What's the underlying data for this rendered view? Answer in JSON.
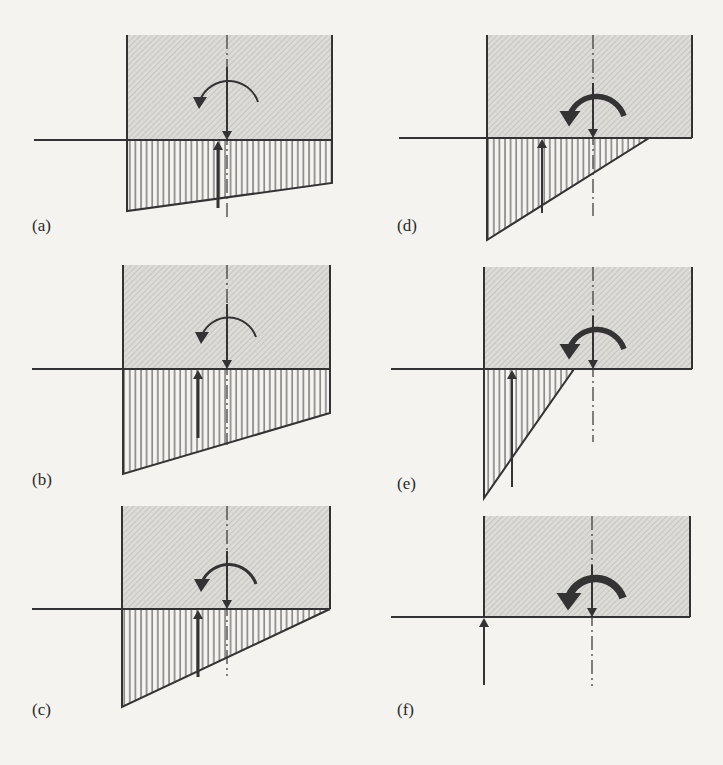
{
  "figure": {
    "colors": {
      "background": "#f4f3f0",
      "ink": "#333333",
      "soil_fill": "#dcdbd8",
      "soil_hatch": "#bdbcb8",
      "pressure_hatch": "#444444"
    },
    "panels": [
      {
        "id": "a",
        "label": "(a)",
        "footing": {
          "left": 127,
          "right": 332,
          "top": 35,
          "base": 140
        },
        "ground_line_start": 34,
        "centerline_x": 227,
        "centerline_bottom": 220,
        "pressure": {
          "left_depth": 211,
          "right_depth": 183,
          "zero_x": null
        },
        "reaction_arrow": {
          "x": 218,
          "bottom": 208
        },
        "moment": {
          "cx": 227,
          "cy": 96,
          "r": 31,
          "weight": "thin"
        },
        "label_pos": {
          "x": 32,
          "y": 216
        }
      },
      {
        "id": "b",
        "label": "(b)",
        "footing": {
          "left": 123,
          "right": 330,
          "top": 265,
          "base": 369
        },
        "ground_line_start": 32,
        "centerline_x": 227,
        "centerline_bottom": 445,
        "pressure": {
          "left_depth": 474,
          "right_depth": 413,
          "zero_x": null
        },
        "reaction_arrow": {
          "x": 198,
          "bottom": 438
        },
        "moment": {
          "cx": 227,
          "cy": 331,
          "r": 29,
          "weight": "thin"
        },
        "label_pos": {
          "x": 32,
          "y": 470
        }
      },
      {
        "id": "c",
        "label": "(c)",
        "footing": {
          "left": 122,
          "right": 330,
          "top": 506,
          "base": 609
        },
        "ground_line_start": 32,
        "centerline_x": 227,
        "centerline_bottom": 676,
        "pressure": {
          "left_depth": 707,
          "right_depth": 609,
          "zero_x": 330
        },
        "reaction_arrow": {
          "x": 198,
          "bottom": 677
        },
        "moment": {
          "cx": 227,
          "cy": 578,
          "r": 29,
          "weight": "medium"
        },
        "label_pos": {
          "x": 32,
          "y": 700
        }
      },
      {
        "id": "d",
        "label": "(d)",
        "footing": {
          "left": 487,
          "right": 692,
          "top": 35,
          "base": 138
        },
        "ground_line_start": 399,
        "centerline_x": 593,
        "centerline_bottom": 216,
        "pressure": {
          "left_depth": 240,
          "right_depth": 138,
          "zero_x": 649
        },
        "reaction_arrow": {
          "x": 542,
          "bottom": 213
        },
        "moment": {
          "cx": 595,
          "cy": 110,
          "r": 29,
          "weight": "bold"
        },
        "label_pos": {
          "x": 397,
          "y": 216
        }
      },
      {
        "id": "e",
        "label": "(e)",
        "footing": {
          "left": 484,
          "right": 692,
          "top": 267,
          "base": 369
        },
        "ground_line_start": 391,
        "centerline_x": 593,
        "centerline_bottom": 442,
        "pressure": {
          "left_depth": 498,
          "right_depth": 369,
          "zero_x": 574
        },
        "reaction_arrow": {
          "x": 512,
          "bottom": 487
        },
        "moment": {
          "cx": 595,
          "cy": 343,
          "r": 29,
          "weight": "bold"
        },
        "label_pos": {
          "x": 397,
          "y": 474
        }
      },
      {
        "id": "f",
        "label": "(f)",
        "footing": {
          "left": 484,
          "right": 690,
          "top": 516,
          "base": 617
        },
        "ground_line_start": 391,
        "centerline_x": 592,
        "centerline_bottom": 686,
        "pressure": {
          "left_depth": 617,
          "right_depth": 617,
          "zero_x": 484
        },
        "reaction_arrow": {
          "x": 484,
          "bottom": 685
        },
        "moment": {
          "cx": 594,
          "cy": 592,
          "r": 29,
          "weight": "heaviest"
        },
        "label_pos": {
          "x": 397,
          "y": 700
        }
      }
    ]
  }
}
